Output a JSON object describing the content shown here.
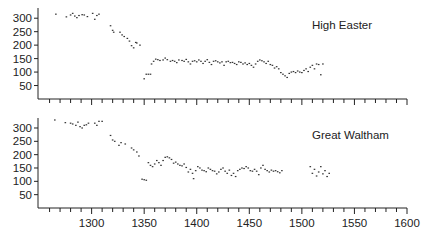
{
  "chart_data": [
    {
      "type": "scatter",
      "title": "High Easter",
      "xlabel": "",
      "ylabel": "",
      "xlim": [
        1249,
        1600
      ],
      "ylim": [
        0,
        350
      ],
      "yticks": [
        50,
        100,
        150,
        200,
        250,
        300
      ],
      "xticks_minor_step": 10,
      "grid": false,
      "x_tick_labels_shown": false,
      "points": [
        [
          1266,
          315
        ],
        [
          1276,
          305
        ],
        [
          1280,
          312
        ],
        [
          1282,
          318
        ],
        [
          1284,
          308
        ],
        [
          1286,
          302
        ],
        [
          1288,
          310
        ],
        [
          1291,
          313
        ],
        [
          1293,
          312
        ],
        [
          1296,
          306
        ],
        [
          1301,
          318
        ],
        [
          1303,
          296
        ],
        [
          1305,
          310
        ],
        [
          1307,
          315
        ],
        [
          1318,
          272
        ],
        [
          1320,
          255
        ],
        [
          1321,
          248
        ],
        [
          1327,
          248
        ],
        [
          1329,
          238
        ],
        [
          1331,
          232
        ],
        [
          1334,
          225
        ],
        [
          1336,
          215
        ],
        [
          1338,
          198
        ],
        [
          1340,
          190
        ],
        [
          1342,
          210
        ],
        [
          1343,
          208
        ],
        [
          1346,
          200
        ],
        [
          1350,
          75
        ],
        [
          1352,
          92
        ],
        [
          1354,
          92
        ],
        [
          1356,
          92
        ],
        [
          1357,
          130
        ],
        [
          1359,
          140
        ],
        [
          1361,
          148
        ],
        [
          1363,
          146
        ],
        [
          1365,
          143
        ],
        [
          1368,
          145
        ],
        [
          1370,
          152
        ],
        [
          1372,
          146
        ],
        [
          1375,
          140
        ],
        [
          1377,
          143
        ],
        [
          1379,
          140
        ],
        [
          1381,
          135
        ],
        [
          1383,
          145
        ],
        [
          1386,
          143
        ],
        [
          1388,
          140
        ],
        [
          1390,
          147
        ],
        [
          1392,
          138
        ],
        [
          1394,
          130
        ],
        [
          1396,
          140
        ],
        [
          1398,
          142
        ],
        [
          1400,
          138
        ],
        [
          1402,
          145
        ],
        [
          1404,
          140
        ],
        [
          1406,
          132
        ],
        [
          1408,
          140
        ],
        [
          1410,
          146
        ],
        [
          1412,
          136
        ],
        [
          1414,
          128
        ],
        [
          1416,
          140
        ],
        [
          1418,
          142
        ],
        [
          1420,
          138
        ],
        [
          1422,
          134
        ],
        [
          1424,
          138
        ],
        [
          1426,
          125
        ],
        [
          1428,
          138
        ],
        [
          1430,
          140
        ],
        [
          1432,
          135
        ],
        [
          1434,
          136
        ],
        [
          1436,
          132
        ],
        [
          1438,
          128
        ],
        [
          1440,
          138
        ],
        [
          1442,
          136
        ],
        [
          1444,
          130
        ],
        [
          1446,
          134
        ],
        [
          1448,
          128
        ],
        [
          1450,
          132
        ],
        [
          1452,
          125
        ],
        [
          1454,
          118
        ],
        [
          1456,
          130
        ],
        [
          1458,
          140
        ],
        [
          1460,
          145
        ],
        [
          1462,
          142
        ],
        [
          1464,
          138
        ],
        [
          1466,
          132
        ],
        [
          1468,
          140
        ],
        [
          1470,
          128
        ],
        [
          1472,
          125
        ],
        [
          1474,
          115
        ],
        [
          1476,
          120
        ],
        [
          1478,
          112
        ],
        [
          1480,
          98
        ],
        [
          1482,
          92
        ],
        [
          1484,
          86
        ],
        [
          1486,
          80
        ],
        [
          1488,
          95
        ],
        [
          1490,
          100
        ],
        [
          1492,
          102
        ],
        [
          1494,
          98
        ],
        [
          1496,
          104
        ],
        [
          1498,
          100
        ],
        [
          1500,
          98
        ],
        [
          1502,
          106
        ],
        [
          1504,
          112
        ],
        [
          1506,
          102
        ],
        [
          1508,
          118
        ],
        [
          1510,
          125
        ],
        [
          1512,
          112
        ],
        [
          1514,
          130
        ],
        [
          1516,
          128
        ],
        [
          1518,
          90
        ],
        [
          1520,
          130
        ]
      ]
    },
    {
      "type": "scatter",
      "title": "Great Waltham",
      "xlabel": "",
      "ylabel": "",
      "xlim": [
        1249,
        1600
      ],
      "ylim": [
        0,
        350
      ],
      "yticks": [
        50,
        100,
        150,
        200,
        250,
        300
      ],
      "xticks": [
        1300,
        1350,
        1400,
        1450,
        1500,
        1550,
        1600
      ],
      "xticks_minor_step": 10,
      "grid": false,
      "points": [
        [
          1265,
          330
        ],
        [
          1275,
          320
        ],
        [
          1280,
          318
        ],
        [
          1282,
          315
        ],
        [
          1285,
          310
        ],
        [
          1287,
          322
        ],
        [
          1289,
          305
        ],
        [
          1291,
          300
        ],
        [
          1293,
          310
        ],
        [
          1295,
          312
        ],
        [
          1297,
          318
        ],
        [
          1303,
          318
        ],
        [
          1305,
          310
        ],
        [
          1307,
          325
        ],
        [
          1310,
          325
        ],
        [
          1318,
          272
        ],
        [
          1320,
          255
        ],
        [
          1322,
          250
        ],
        [
          1326,
          235
        ],
        [
          1328,
          245
        ],
        [
          1332,
          240
        ],
        [
          1338,
          225
        ],
        [
          1340,
          218
        ],
        [
          1343,
          210
        ],
        [
          1345,
          195
        ],
        [
          1348,
          108
        ],
        [
          1350,
          106
        ],
        [
          1352,
          104
        ],
        [
          1354,
          170
        ],
        [
          1356,
          160
        ],
        [
          1358,
          155
        ],
        [
          1360,
          165
        ],
        [
          1362,
          178
        ],
        [
          1364,
          170
        ],
        [
          1366,
          160
        ],
        [
          1368,
          178
        ],
        [
          1370,
          190
        ],
        [
          1372,
          192
        ],
        [
          1374,
          188
        ],
        [
          1376,
          182
        ],
        [
          1378,
          168
        ],
        [
          1380,
          172
        ],
        [
          1382,
          165
        ],
        [
          1384,
          160
        ],
        [
          1386,
          158
        ],
        [
          1388,
          165
        ],
        [
          1390,
          152
        ],
        [
          1392,
          135
        ],
        [
          1394,
          145
        ],
        [
          1396,
          130
        ],
        [
          1397,
          110
        ],
        [
          1399,
          140
        ],
        [
          1401,
          155
        ],
        [
          1403,
          150
        ],
        [
          1405,
          142
        ],
        [
          1407,
          140
        ],
        [
          1409,
          136
        ],
        [
          1411,
          150
        ],
        [
          1413,
          145
        ],
        [
          1415,
          140
        ],
        [
          1417,
          138
        ],
        [
          1419,
          128
        ],
        [
          1421,
          135
        ],
        [
          1423,
          145
        ],
        [
          1425,
          150
        ],
        [
          1427,
          138
        ],
        [
          1429,
          130
        ],
        [
          1431,
          142
        ],
        [
          1433,
          122
        ],
        [
          1435,
          130
        ],
        [
          1437,
          118
        ],
        [
          1439,
          140
        ],
        [
          1441,
          145
        ],
        [
          1443,
          150
        ],
        [
          1445,
          148
        ],
        [
          1447,
          155
        ],
        [
          1449,
          150
        ],
        [
          1451,
          140
        ],
        [
          1453,
          138
        ],
        [
          1455,
          145
        ],
        [
          1457,
          138
        ],
        [
          1459,
          125
        ],
        [
          1461,
          150
        ],
        [
          1463,
          160
        ],
        [
          1465,
          145
        ],
        [
          1467,
          140
        ],
        [
          1469,
          135
        ],
        [
          1471,
          142
        ],
        [
          1473,
          138
        ],
        [
          1475,
          140
        ],
        [
          1477,
          136
        ],
        [
          1479,
          132
        ],
        [
          1481,
          140
        ],
        [
          1508,
          155
        ],
        [
          1510,
          130
        ],
        [
          1512,
          145
        ],
        [
          1514,
          120
        ],
        [
          1516,
          135
        ],
        [
          1518,
          155
        ],
        [
          1520,
          128
        ],
        [
          1522,
          140
        ],
        [
          1524,
          118
        ],
        [
          1526,
          130
        ]
      ]
    }
  ],
  "panels": {
    "top": {
      "label": "High Easter"
    },
    "bottom": {
      "label": "Great Waltham"
    }
  },
  "colors": {
    "points": "#333333",
    "axis": "#222222",
    "background": "#ffffff"
  }
}
